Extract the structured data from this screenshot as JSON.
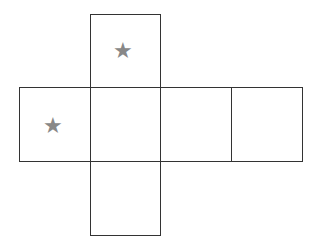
{
  "diagram": {
    "type": "cube-net",
    "faces": [
      {
        "id": "top",
        "symbol": "★",
        "has_star": true
      },
      {
        "id": "left",
        "symbol": "★",
        "has_star": true
      },
      {
        "id": "center",
        "symbol": "",
        "has_star": false
      },
      {
        "id": "right",
        "symbol": "",
        "has_star": false
      },
      {
        "id": "far-right",
        "symbol": "",
        "has_star": false
      },
      {
        "id": "bottom",
        "symbol": "",
        "has_star": false
      }
    ],
    "star_color": "#888888",
    "line_color": "#333333"
  }
}
